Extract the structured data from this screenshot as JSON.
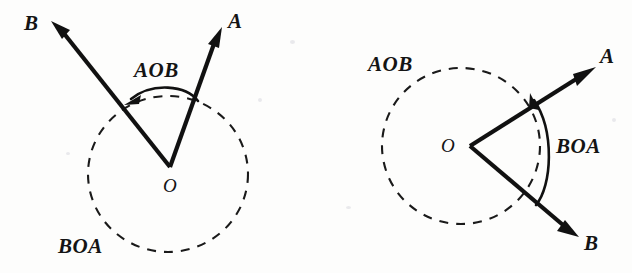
{
  "figure": {
    "background_color": "#fdfdfc",
    "ink_color": "#111111",
    "diagrams": [
      {
        "name": "left-diagram",
        "description": "Acute angle AOB with rays pointing up-left and up-right from vertex O, dashed circle centered near O",
        "vertex_label": "O",
        "ray_a_label": "A",
        "ray_b_label": "B",
        "marked_angle_label": "AOB",
        "reflex_angle_label": "BOA"
      },
      {
        "name": "right-diagram",
        "description": "Reflex-marked angle BOA with rays pointing up-right and down-right from vertex O, dashed circle centered on O",
        "vertex_label": "O",
        "ray_a_label": "A",
        "ray_b_label": "B",
        "marked_angle_label": "BOA",
        "unmarked_angle_label": "AOB"
      }
    ]
  },
  "left": {
    "label_b": "B",
    "label_a": "A",
    "label_aob": "AOB",
    "label_o": "O",
    "label_boa": "BOA"
  },
  "right": {
    "label_aob": "AOB",
    "label_a": "A",
    "label_o": "O",
    "label_boa": "BOA",
    "label_b": "B"
  }
}
